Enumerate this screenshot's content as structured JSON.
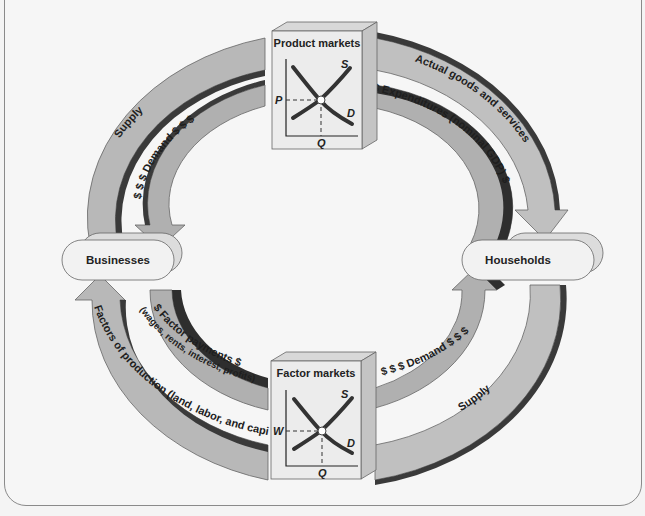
{
  "diagram": {
    "colors": {
      "background": "#f6f6f6",
      "arrow_fill": "#b4b4b4",
      "arrow_light": "#c8c8c8",
      "arrow_dark": "#3a3a3a",
      "box_fill": "#ececec",
      "node_fill": "#f2f2f2",
      "outline": "#555555"
    },
    "nodes": {
      "businesses": {
        "label": "Businesses"
      },
      "households": {
        "label": "Households"
      }
    },
    "markets": {
      "product": {
        "title": "Product markets",
        "supply_label": "S",
        "demand_label": "D",
        "price_label": "P",
        "quantity_label": "Q"
      },
      "factor": {
        "title": "Factor markets",
        "supply_label": "S",
        "demand_label": "D",
        "price_label": "W",
        "quantity_label": "Q"
      }
    },
    "flows": {
      "top_outer_left": "Supply",
      "top_inner_left": "$ $ $ Demand $ $ $",
      "top_outer_right": "Actual goods and services",
      "top_inner_right": "$ Expenditures (nominal GDP) $",
      "bottom_inner_left": "$ Factor payments $",
      "bottom_inner_left_sub": "(wages, rents, interest, profits)",
      "bottom_outer_left": "Factors of production (land, labor, and capital)",
      "bottom_inner_right": "$ $ $ Demand $ $ $",
      "bottom_outer_right": "Supply"
    }
  }
}
